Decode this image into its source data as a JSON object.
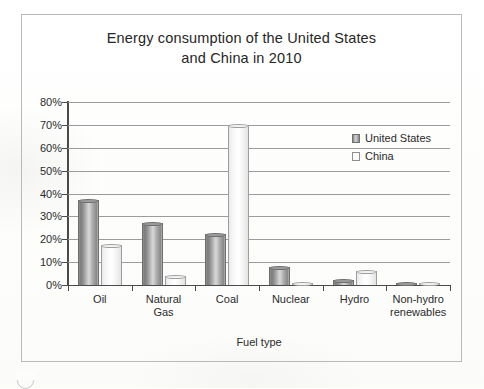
{
  "chart_data": {
    "type": "bar",
    "title": "Energy consumption of the United States and China in 2010",
    "title_lines": [
      "Energy consumption of the United States",
      "and China in 2010"
    ],
    "xlabel": "Fuel type",
    "ylabel": "",
    "categories": [
      "Oil",
      "Natural Gas",
      "Coal",
      "Nuclear",
      "Hydro",
      "Non-hydro renewables"
    ],
    "category_lines": [
      [
        "Oil"
      ],
      [
        "Natural",
        "Gas"
      ],
      [
        "Coal"
      ],
      [
        "Nuclear"
      ],
      [
        "Hydro"
      ],
      [
        "Non-hydro",
        "renewables"
      ]
    ],
    "series": [
      {
        "name": "United States",
        "values": [
          37,
          27,
          22.5,
          8,
          2,
          1
        ]
      },
      {
        "name": "China",
        "values": [
          17.5,
          4,
          70,
          1,
          6,
          0.5
        ]
      }
    ],
    "ylim": [
      0,
      80
    ],
    "ytick_step": 10,
    "ytick_labels": [
      "80%",
      "70%",
      "60%",
      "50%",
      "40%",
      "30%",
      "20%",
      "10%",
      "0%"
    ],
    "ytick_values": [
      80,
      70,
      60,
      50,
      40,
      30,
      20,
      10,
      0
    ],
    "grid": true,
    "legend_position": "upper-right-inside",
    "value_unit": "%"
  },
  "legend": {
    "entries": [
      {
        "label": "United States",
        "swatch": "us"
      },
      {
        "label": "China",
        "swatch": "cn"
      }
    ]
  },
  "colors": {
    "bar_us_dark": "#7c7c7c",
    "bar_us_light": "#d8d8d8",
    "bar_cn": "#fbfbfb",
    "bar_outline": "#6f6f6f",
    "axis": "#4a4a4a",
    "gridline": "#9c9c9c",
    "frame": "#b9b9b9",
    "text": "#2b2b2b"
  }
}
